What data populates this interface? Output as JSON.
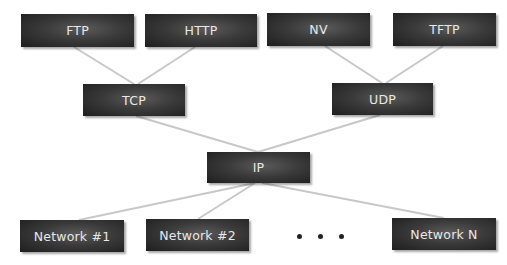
{
  "diagram": {
    "type": "protocol-hierarchy",
    "line_color": "#c8c8c8",
    "node_color": "#333333",
    "node_text_color": "#e8e8e8",
    "nodes": [
      {
        "id": "ftp",
        "label": "FTP",
        "x": 21,
        "y": 14,
        "w": 113,
        "h": 33
      },
      {
        "id": "http",
        "label": "HTTP",
        "x": 145,
        "y": 14,
        "w": 112,
        "h": 33
      },
      {
        "id": "nv",
        "label": "NV",
        "x": 267,
        "y": 13,
        "w": 103,
        "h": 33
      },
      {
        "id": "tftp",
        "label": "TFTP",
        "x": 393,
        "y": 13,
        "w": 103,
        "h": 33
      },
      {
        "id": "tcp",
        "label": "TCP",
        "x": 83,
        "y": 84,
        "w": 102,
        "h": 32
      },
      {
        "id": "udp",
        "label": "UDP",
        "x": 332,
        "y": 83,
        "w": 101,
        "h": 32
      },
      {
        "id": "ip",
        "label": "IP",
        "x": 207,
        "y": 152,
        "w": 103,
        "h": 31
      },
      {
        "id": "net1",
        "label": "Network #1",
        "x": 20,
        "y": 220,
        "w": 104,
        "h": 32
      },
      {
        "id": "net2",
        "label": "Network #2",
        "x": 146,
        "y": 219,
        "w": 103,
        "h": 32
      },
      {
        "id": "netn",
        "label": "Network N",
        "x": 392,
        "y": 218,
        "w": 104,
        "h": 32
      }
    ],
    "edges": [
      {
        "from": "ftp",
        "to": "tcp",
        "x1": 74,
        "y1": 47,
        "x2": 134,
        "y2": 84
      },
      {
        "from": "http",
        "to": "tcp",
        "x1": 195,
        "y1": 47,
        "x2": 138,
        "y2": 84
      },
      {
        "from": "nv",
        "to": "udp",
        "x1": 325,
        "y1": 46,
        "x2": 382,
        "y2": 83
      },
      {
        "from": "tftp",
        "to": "udp",
        "x1": 443,
        "y1": 46,
        "x2": 386,
        "y2": 83
      },
      {
        "from": "tcp",
        "to": "ip",
        "x1": 136,
        "y1": 116,
        "x2": 258,
        "y2": 152
      },
      {
        "from": "udp",
        "to": "ip",
        "x1": 380,
        "y1": 115,
        "x2": 258,
        "y2": 152
      },
      {
        "from": "ip",
        "to": "net1",
        "x1": 255,
        "y1": 183,
        "x2": 79,
        "y2": 220
      },
      {
        "from": "ip",
        "to": "net2",
        "x1": 255,
        "y1": 183,
        "x2": 198,
        "y2": 219
      },
      {
        "from": "ip",
        "to": "netn",
        "x1": 262,
        "y1": 183,
        "x2": 444,
        "y2": 218
      }
    ],
    "ellipsis": {
      "label": "• • •",
      "x": 297,
      "y": 234
    }
  }
}
